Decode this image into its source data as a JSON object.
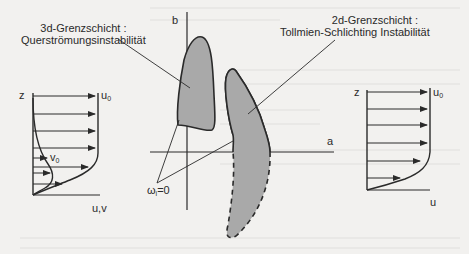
{
  "figure": {
    "left_caption": {
      "line1": "3d-Grenzschicht :",
      "line2": "Querströmungsinstabilität"
    },
    "right_caption": {
      "line1": "2d-Grenzschicht :",
      "line2": "Tollmien-Schlichting Instabilität"
    },
    "center_plot": {
      "axis_vertical_label": "b",
      "axis_horizontal_label": "a",
      "neutral_curve_label": "ω",
      "neutral_curve_subscript": "i",
      "neutral_curve_value": "=0"
    },
    "left_profile": {
      "z_label": "z",
      "u0_label": "u",
      "u0_subscript": "0",
      "v0_label": "v",
      "v0_subscript": "0",
      "axis_label": "u,v"
    },
    "right_profile": {
      "z_label": "z",
      "u0_label": "u",
      "u0_subscript": "0",
      "axis_label": "u"
    },
    "colors": {
      "ink": "#2a2a2a",
      "fill": "#a9a9a9",
      "paper": "#f2f1ef"
    }
  }
}
